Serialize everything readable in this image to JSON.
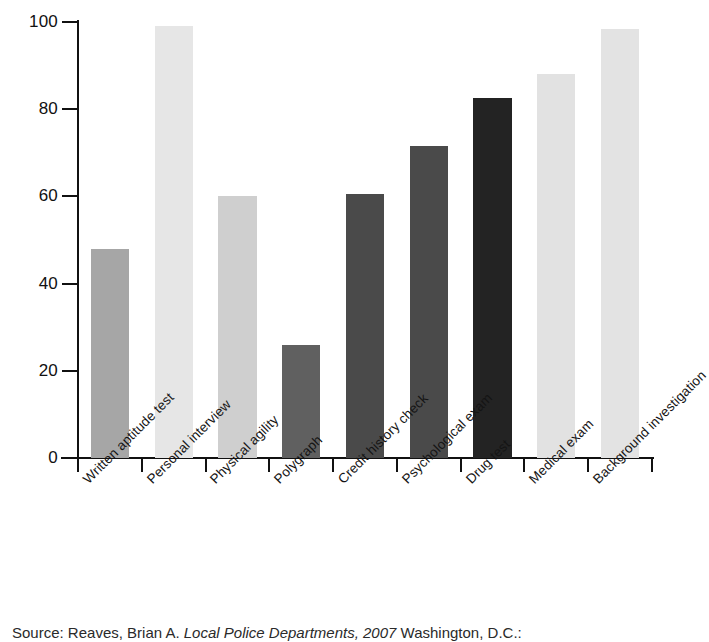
{
  "chart_data": {
    "type": "bar",
    "title": "",
    "subtitle": "",
    "xlabel": "",
    "ylabel": "",
    "ylim": [
      0,
      100
    ],
    "yticks": [
      0,
      20,
      40,
      60,
      80,
      100
    ],
    "ytick_labels": [
      "0",
      "20",
      "40",
      "60",
      "80",
      "100"
    ],
    "grid": false,
    "legend": false,
    "legend_position": "none",
    "orientation": "vertical",
    "categories": [
      "Written aptitude test",
      "Personal interview",
      "Physical agility",
      "Polygraph",
      "Credit history check",
      "Psychological exam",
      "Drug test",
      "Medical exam",
      "Background investigation"
    ],
    "values": [
      48,
      99,
      60,
      26,
      60.5,
      71.5,
      82.5,
      88,
      98.5
    ],
    "bar_colors": [
      "#a6a6a6",
      "#e6e6e6",
      "#cfcfcf",
      "#606060",
      "#4a4a4a",
      "#4a4a4a",
      "#232323",
      "#e2e2e2",
      "#e3e3e3"
    ],
    "axis_color": "#111111"
  },
  "source": {
    "prefix": "Source: Reaves, Brian A. ",
    "italic_title": "Local Police Departments, 2007",
    "suffix": " Washington, D.C.:"
  }
}
